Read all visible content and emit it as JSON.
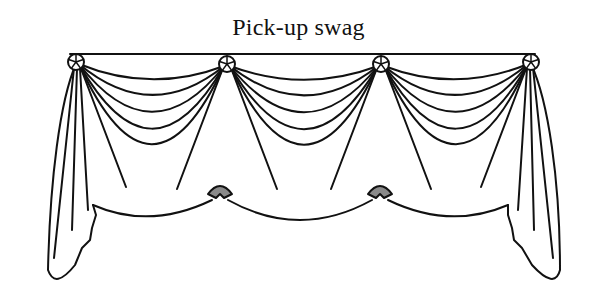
{
  "title": "Pick-up swag",
  "figure": {
    "swag_count": 3,
    "rosette_count": 4,
    "jabot_count": 2,
    "pickup_count": 2,
    "line_color": "#111111",
    "pickup_fill": "#8a8a8a",
    "background": "#ffffff"
  }
}
